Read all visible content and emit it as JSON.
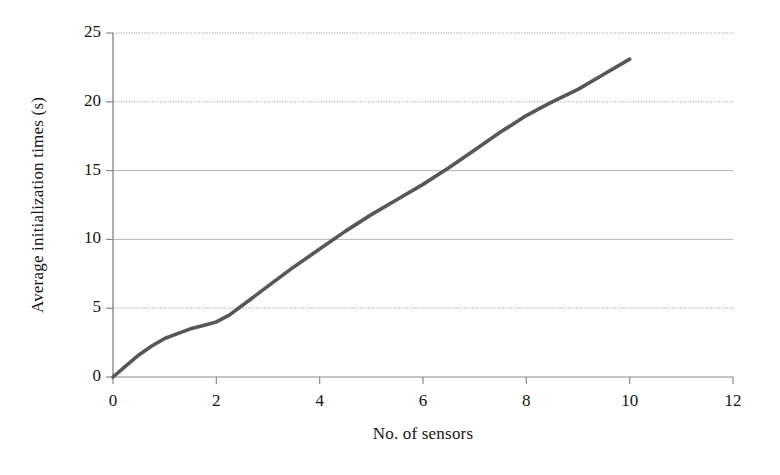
{
  "chart_data": {
    "type": "line",
    "title": "",
    "subtitle": "",
    "xlabel": "No. of sensors",
    "ylabel": "Average initialization times (s)",
    "xlim": [
      0,
      12
    ],
    "ylim": [
      0,
      25
    ],
    "xticks": [
      0,
      2,
      4,
      6,
      8,
      10,
      12
    ],
    "yticks": [
      0,
      5,
      10,
      15,
      20,
      25
    ],
    "xtick_labels": [
      "0",
      "2",
      "4",
      "6",
      "8",
      "10",
      "12"
    ],
    "ytick_labels": [
      "0",
      "5",
      "10",
      "15",
      "20",
      "25"
    ],
    "grid": {
      "horizontal": true,
      "vertical": false,
      "style": "dotted",
      "color": "#9a9a9a"
    },
    "legend": {
      "visible": false,
      "position": "none",
      "entries": []
    },
    "annotations": [],
    "series": [
      {
        "name": "Average initialization time",
        "color": "#575757",
        "line_width": 3.6,
        "marker": "none",
        "x": [
          0,
          0.25,
          0.5,
          0.75,
          1,
          1.25,
          1.5,
          1.75,
          2,
          2.25,
          2.5,
          3,
          3.5,
          4,
          4.5,
          5,
          5.5,
          6,
          6.5,
          7,
          7.5,
          8,
          8.25,
          8.5,
          8.75,
          9,
          9.5,
          10
        ],
        "values": [
          0,
          0.8,
          1.6,
          2.25,
          2.8,
          3.15,
          3.5,
          3.75,
          4.0,
          4.5,
          5.2,
          6.6,
          8.0,
          9.3,
          10.6,
          11.8,
          12.9,
          14.0,
          15.2,
          16.5,
          17.8,
          19.0,
          19.5,
          20.0,
          20.45,
          20.9,
          22.0,
          23.1
        ]
      }
    ]
  },
  "figure": {
    "background_color": "#ffffff",
    "axis_color": "#8a8a8a",
    "text_color": "#141414"
  }
}
